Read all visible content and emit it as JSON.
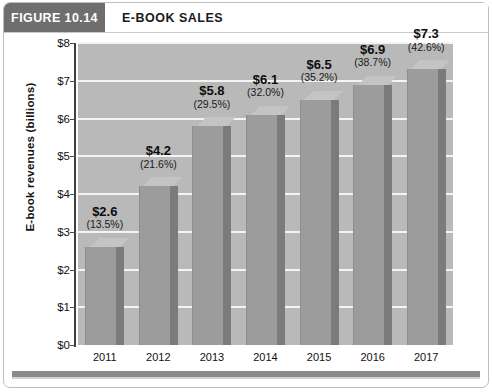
{
  "figure": {
    "tag": "FIGURE 10.14",
    "title": "E-BOOK SALES"
  },
  "colors": {
    "tag_background": "#6e6e6e",
    "plot_background": "#b9b9b9",
    "gridline": "#f4f4f4",
    "bar_front": "#9c9c9c",
    "bar_top": "#c4c4c4",
    "bar_side": "#7b7b7b",
    "axis": "#3d3d3d",
    "footer_bar": "#8a8a8a"
  },
  "chart_data": {
    "type": "bar",
    "title": "E-BOOK SALES",
    "xlabel": "",
    "ylabel": "E-book revenues  (billions)",
    "categories": [
      "2011",
      "2012",
      "2013",
      "2014",
      "2015",
      "2016",
      "2017"
    ],
    "values": [
      2.6,
      4.2,
      5.8,
      6.1,
      6.5,
      6.9,
      7.3
    ],
    "value_labels": [
      "$2.6",
      "$4.2",
      "$5.8",
      "$6.1",
      "$6.5",
      "$6.9",
      "$7.3"
    ],
    "percent_labels": [
      "(13.5%)",
      "(21.6%)",
      "(29.5%)",
      "(32.0%)",
      "(35.2%)",
      "(38.7%)",
      "(42.6%)"
    ],
    "ylim": [
      0,
      8
    ],
    "ytick_values": [
      0,
      1,
      2,
      3,
      4,
      5,
      6,
      7,
      8
    ],
    "ytick_labels": [
      "$0",
      "$1",
      "$2",
      "$3",
      "$4",
      "$5",
      "$6",
      "$7",
      "$8"
    ],
    "grid": true,
    "legend": null
  }
}
